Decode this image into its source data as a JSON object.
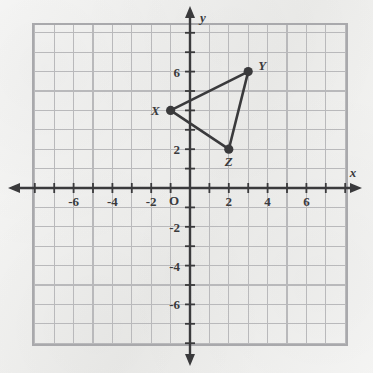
{
  "figure": {
    "axis_labels": {
      "x": "x",
      "y": "y"
    },
    "origin_label": "O",
    "colors": {
      "ink": "#3a3a3c",
      "grid": "#b9b9bb",
      "grid_border": "#a9a9ac",
      "paper": "#f3f3f1"
    }
  },
  "chart_data": {
    "type": "scatter",
    "xlabel": "x",
    "ylabel": "y",
    "xlim": [
      -8,
      8
    ],
    "ylim": [
      -8,
      8
    ],
    "grid": true,
    "grid_step": 1,
    "legend": "none",
    "x_tick_labels": [
      "-6",
      "-4",
      "-2",
      "2",
      "4",
      "6"
    ],
    "x_tick_values": [
      -6,
      -4,
      -2,
      2,
      4,
      6
    ],
    "y_tick_labels": [
      "6",
      "2",
      "-2",
      "-4",
      "-6"
    ],
    "y_tick_values": [
      6,
      2,
      -2,
      -4,
      -6
    ],
    "points": [
      {
        "name": "X",
        "label": "X",
        "x": -1,
        "y": 4,
        "label_position": "left"
      },
      {
        "name": "Y",
        "label": "Y",
        "x": 3,
        "y": 6,
        "label_position": "right"
      },
      {
        "name": "Z",
        "label": "Z",
        "x": 2,
        "y": 2,
        "label_position": "below"
      }
    ],
    "edges": [
      {
        "from": "X",
        "to": "Y"
      },
      {
        "from": "Y",
        "to": "Z"
      },
      {
        "from": "Z",
        "to": "X"
      }
    ]
  }
}
